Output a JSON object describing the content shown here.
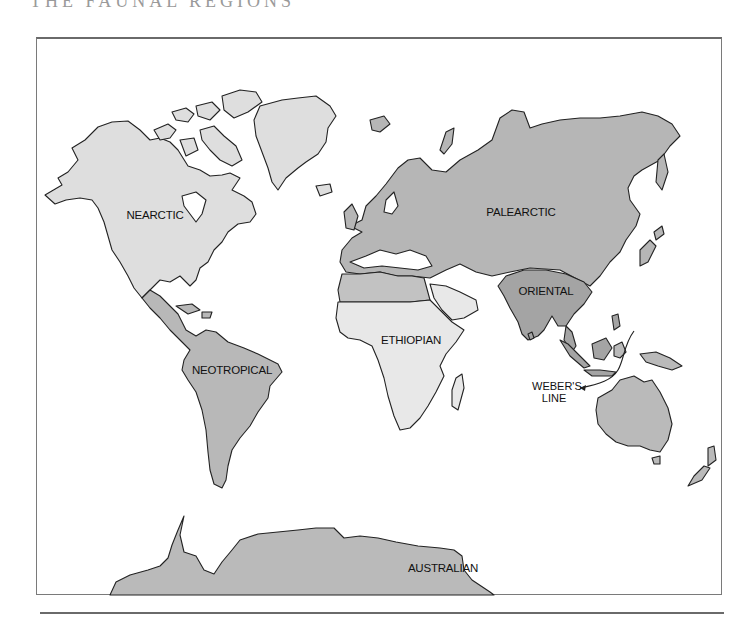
{
  "page": {
    "title_partial": "THE FAUNAL REGIONS"
  },
  "map": {
    "type": "world zoogeographic regions map",
    "colors": {
      "nearctic": "#dedede",
      "palearctic": "#b6b6b6",
      "oriental": "#a4a4a4",
      "ethiopian": "#e8e8e8",
      "ethiopian_sahara": "#c2c2c2",
      "neotropical": "#b8b8b8",
      "australian": "#bababa",
      "coastline": "#222222",
      "frame": "#7a7a7a"
    },
    "regions": [
      {
        "id": "nearctic",
        "label": "NEARCTIC"
      },
      {
        "id": "palearctic",
        "label": "PALEARCTIC"
      },
      {
        "id": "oriental",
        "label": "ORIENTAL"
      },
      {
        "id": "ethiopian",
        "label": "ETHIOPIAN"
      },
      {
        "id": "neotropical",
        "label": "NEOTROPICAL"
      },
      {
        "id": "australian",
        "label": "AUSTRALIAN"
      }
    ],
    "annotations": {
      "webers_line_1": "WEBER'S",
      "webers_line_2": "LINE"
    }
  }
}
